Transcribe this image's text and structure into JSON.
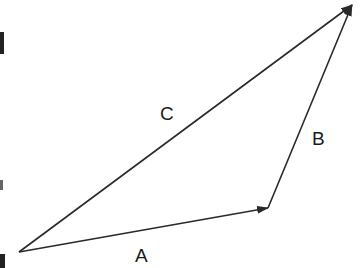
{
  "diagram": {
    "type": "vector-addition-triangle",
    "stroke_color": "#2a2a2a",
    "background": "#ffffff",
    "vectors": [
      {
        "name": "A",
        "label": "A",
        "from": [
          19,
          252
        ],
        "to": [
          268,
          208
        ],
        "label_pos": [
          141,
          262
        ]
      },
      {
        "name": "B",
        "label": "B",
        "from": [
          268,
          208
        ],
        "to": [
          352,
          5
        ],
        "label_pos": [
          318,
          145
        ]
      },
      {
        "name": "C",
        "label": "C",
        "from": [
          19,
          252
        ],
        "to": [
          352,
          5
        ],
        "label_pos": [
          166,
          120
        ]
      }
    ]
  }
}
